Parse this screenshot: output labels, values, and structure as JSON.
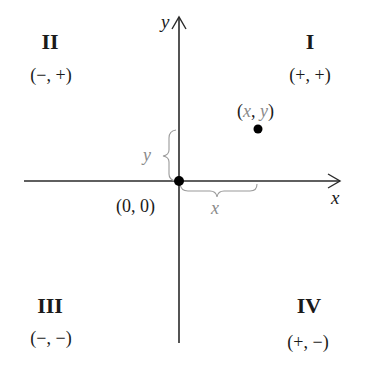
{
  "diagram": {
    "axes": {
      "x_label": "x",
      "y_label": "y",
      "origin_label": "(0, 0)"
    },
    "quadrants": [
      {
        "numeral": "I",
        "signs": "(+, +)"
      },
      {
        "numeral": "II",
        "signs": "(−, +)"
      },
      {
        "numeral": "III",
        "signs": "(−, −)"
      },
      {
        "numeral": "IV",
        "signs": "(+, −)"
      }
    ],
    "point": {
      "label_open": "(",
      "label_x": "x",
      "label_sep": ", ",
      "label_y": "y",
      "label_close": ")"
    },
    "braces": {
      "horizontal_label": "x",
      "vertical_label": "y"
    },
    "colors": {
      "axis": "#2a2a2a",
      "text": "#1a1a1a",
      "annotation_gray": "#8a8a8a",
      "point": "#000000"
    }
  }
}
